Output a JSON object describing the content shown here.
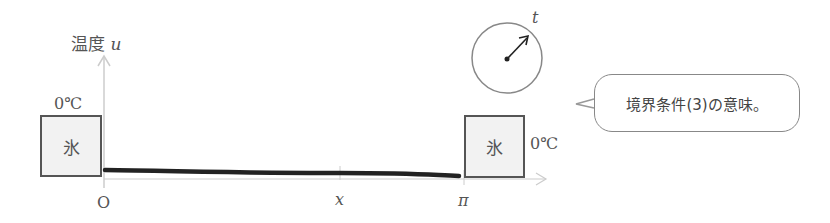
{
  "axes": {
    "y_label": "温度",
    "y_var": "u",
    "origin": "O",
    "x_var": "x",
    "x_end": "π"
  },
  "left_ice": {
    "label": "氷",
    "temp": "0℃"
  },
  "right_ice": {
    "label": "氷",
    "temp": "0℃"
  },
  "clock": {
    "var": "t"
  },
  "callout": {
    "text": "境界条件(3)の意味。"
  },
  "colors": {
    "axis": "#cccccc",
    "rod": "#222222",
    "ice_fill": "#f2f2f2",
    "ice_border": "#555555",
    "text": "#555555"
  }
}
